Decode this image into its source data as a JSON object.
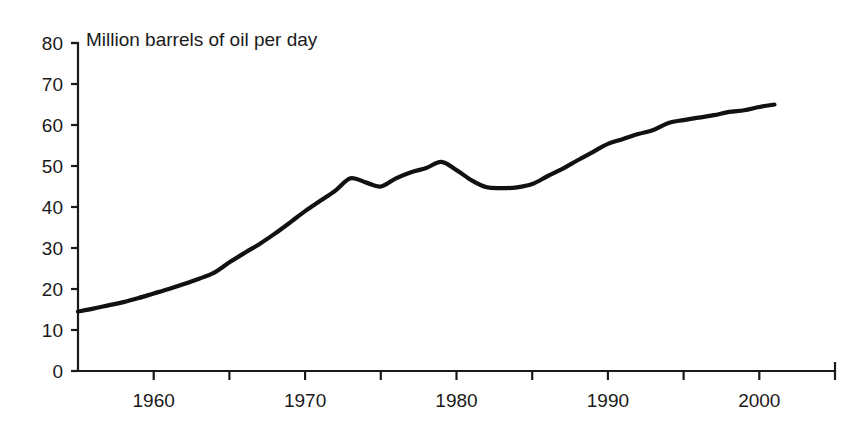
{
  "chart_data": {
    "type": "line",
    "title": "Million barrels of oil per day",
    "subtitle": "",
    "xlabel": "",
    "ylabel": "",
    "xlim": [
      1955,
      2005
    ],
    "ylim": [
      0,
      80
    ],
    "grid": false,
    "legend": null,
    "legend_position": "none",
    "y_ticks": [
      0,
      10,
      20,
      30,
      40,
      50,
      60,
      70,
      80
    ],
    "y_tick_labels": [
      "0",
      "10",
      "20",
      "30",
      "40",
      "50",
      "60",
      "70",
      "80"
    ],
    "x_ticks": [
      1955,
      1960,
      1965,
      1970,
      1975,
      1980,
      1985,
      1990,
      1995,
      2000,
      2005
    ],
    "x_tick_labels": [
      "",
      "1960",
      "",
      "1970",
      "",
      "1980",
      "",
      "1990",
      "",
      "2000",
      ""
    ],
    "x_labeled_ticks": [
      {
        "value": 1960,
        "label": "1960"
      },
      {
        "value": 1970,
        "label": "1970"
      },
      {
        "value": 1980,
        "label": "1980"
      },
      {
        "value": 1990,
        "label": "1990"
      },
      {
        "value": 2000,
        "label": "2000"
      }
    ],
    "line_color": "#111111",
    "axis_color": "#1a1a1a",
    "background_color": "#ffffff",
    "x": [
      1955,
      1956,
      1957,
      1958,
      1959,
      1960,
      1961,
      1962,
      1963,
      1964,
      1965,
      1966,
      1967,
      1968,
      1969,
      1970,
      1971,
      1972,
      1973,
      1974,
      1975,
      1976,
      1977,
      1978,
      1979,
      1980,
      1981,
      1982,
      1983,
      1984,
      1985,
      1986,
      1987,
      1988,
      1989,
      1990,
      1991,
      1992,
      1993,
      1994,
      1995,
      1996,
      1997,
      1998,
      1999,
      2000,
      2001
    ],
    "values": [
      14.5,
      15.2,
      16.0,
      16.8,
      17.8,
      18.9,
      20.0,
      21.2,
      22.5,
      24.0,
      26.5,
      28.8,
      31.0,
      33.5,
      36.2,
      39.0,
      41.5,
      44.0,
      47.0,
      46.0,
      45.0,
      47.0,
      48.5,
      49.5,
      51.0,
      49.0,
      46.5,
      44.8,
      44.6,
      44.8,
      45.6,
      47.5,
      49.3,
      51.4,
      53.4,
      55.4,
      56.6,
      57.8,
      58.8,
      60.5,
      61.2,
      61.8,
      62.4,
      63.2,
      63.6,
      64.4,
      65.0
    ],
    "series": [
      {
        "name": "World oil production",
        "values": [
          14.5,
          15.2,
          16.0,
          16.8,
          17.8,
          18.9,
          20.0,
          21.2,
          22.5,
          24.0,
          26.5,
          28.8,
          31.0,
          33.5,
          36.2,
          39.0,
          41.5,
          44.0,
          47.0,
          46.0,
          45.0,
          47.0,
          48.5,
          49.5,
          51.0,
          49.0,
          46.5,
          44.8,
          44.6,
          44.8,
          45.6,
          47.5,
          49.3,
          51.4,
          53.4,
          55.4,
          56.6,
          57.8,
          58.8,
          60.5,
          61.2,
          61.8,
          62.4,
          63.2,
          63.6,
          64.4,
          65.0
        ]
      }
    ]
  }
}
